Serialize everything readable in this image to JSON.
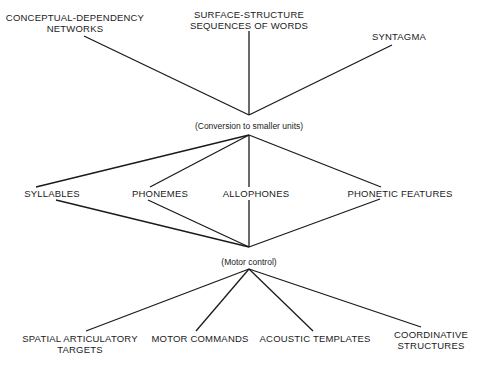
{
  "diagram": {
    "levels": [
      {
        "name": "input-representations",
        "nodes": [
          {
            "id": "conceptual",
            "lines": [
              "CONCEPTUAL-DEPENDENCY",
              "NETWORKS"
            ],
            "x": 75,
            "y": 12
          },
          {
            "id": "surface",
            "lines": [
              "SURFACE-STRUCTURE",
              "SEQUENCES OF WORDS"
            ],
            "x": 249,
            "y": 9
          },
          {
            "id": "syntagma",
            "lines": [
              "SYNTAGMA"
            ],
            "x": 399,
            "y": 31
          }
        ]
      },
      {
        "name": "phonological-units",
        "nodes": [
          {
            "id": "syllables",
            "lines": [
              "SYLLABLES"
            ],
            "x": 52,
            "y": 188
          },
          {
            "id": "phonemes",
            "lines": [
              "PHONEMES"
            ],
            "x": 160,
            "y": 188
          },
          {
            "id": "allophones",
            "lines": [
              "ALLOPHONES"
            ],
            "x": 256,
            "y": 188
          },
          {
            "id": "phonetic-features",
            "lines": [
              "PHONETIC FEATURES"
            ],
            "x": 400,
            "y": 188
          }
        ]
      },
      {
        "name": "output-targets",
        "nodes": [
          {
            "id": "spatial",
            "lines": [
              "SPATIAL ARTICULATORY",
              "TARGETS"
            ],
            "x": 80,
            "y": 333
          },
          {
            "id": "motor-commands",
            "lines": [
              "MOTOR COMMANDS"
            ],
            "x": 200,
            "y": 333
          },
          {
            "id": "acoustic",
            "lines": [
              "ACOUSTIC TEMPLATES"
            ],
            "x": 315,
            "y": 333
          },
          {
            "id": "coordinative",
            "lines": [
              "COORDINATIVE",
              "STRUCTURES"
            ],
            "x": 431,
            "y": 329
          }
        ]
      }
    ],
    "processes": [
      {
        "id": "conversion",
        "label": "(Conversion to smaller units)",
        "x": 249,
        "y": 121
      },
      {
        "id": "motor-control",
        "label": "(Motor control)",
        "x": 249,
        "y": 257
      }
    ],
    "edges": [
      {
        "from": "conceptual",
        "x1": 84,
        "y1": 36,
        "x2": 249,
        "y2": 115
      },
      {
        "from": "surface",
        "x1": 249,
        "y1": 31,
        "x2": 249,
        "y2": 115
      },
      {
        "from": "syntagma",
        "x1": 392,
        "y1": 45,
        "x2": 249,
        "y2": 115
      },
      {
        "from": "conversion",
        "to": "syllables",
        "x1": 249,
        "y1": 135,
        "x2": 36,
        "y2": 187
      },
      {
        "from": "conversion",
        "to": "phonemes",
        "x1": 249,
        "y1": 135,
        "x2": 150,
        "y2": 187
      },
      {
        "from": "conversion",
        "to": "allophones",
        "x1": 249,
        "y1": 135,
        "x2": 249,
        "y2": 187
      },
      {
        "from": "conversion",
        "to": "phonetic-features",
        "x1": 249,
        "y1": 135,
        "x2": 381,
        "y2": 187
      },
      {
        "from": "syllables",
        "x1": 56,
        "y1": 200,
        "x2": 249,
        "y2": 247
      },
      {
        "from": "phonemes",
        "x1": 148,
        "y1": 200,
        "x2": 249,
        "y2": 247
      },
      {
        "from": "allophones",
        "x1": 249,
        "y1": 200,
        "x2": 249,
        "y2": 247
      },
      {
        "from": "phonetic-features",
        "x1": 380,
        "y1": 199,
        "x2": 249,
        "y2": 247
      },
      {
        "from": "motor-control",
        "to": "spatial",
        "x1": 249,
        "y1": 269,
        "x2": 86,
        "y2": 331
      },
      {
        "from": "motor-control",
        "to": "motor-commands",
        "x1": 249,
        "y1": 269,
        "x2": 196,
        "y2": 331
      },
      {
        "from": "motor-control",
        "to": "acoustic",
        "x1": 249,
        "y1": 269,
        "x2": 313,
        "y2": 331
      },
      {
        "from": "motor-control",
        "to": "coordinative",
        "x1": 249,
        "y1": 269,
        "x2": 421,
        "y2": 327
      }
    ]
  }
}
